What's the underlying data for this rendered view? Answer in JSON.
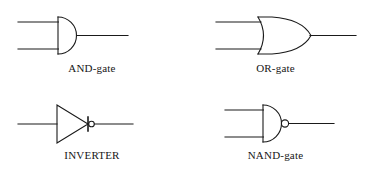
{
  "figure": {
    "background_color": "#ffffff",
    "stroke_color": "#1a1a1a",
    "label_color": "#161616"
  },
  "gates": [
    {
      "id": "and-gate",
      "label": "AND-gate",
      "icon": "and-gate-symbol",
      "inputs": 2,
      "inverted_output": false,
      "body_shape": "d-shape"
    },
    {
      "id": "or-gate",
      "label": "OR-gate",
      "icon": "or-gate-symbol",
      "inputs": 2,
      "inverted_output": false,
      "body_shape": "curved-shield"
    },
    {
      "id": "inverter",
      "label": "INVERTER",
      "icon": "inverter-symbol",
      "inputs": 1,
      "inverted_output": true,
      "body_shape": "triangle"
    },
    {
      "id": "nand-gate",
      "label": "NAND-gate",
      "icon": "nand-gate-symbol",
      "inputs": 2,
      "inverted_output": true,
      "body_shape": "d-shape"
    }
  ]
}
